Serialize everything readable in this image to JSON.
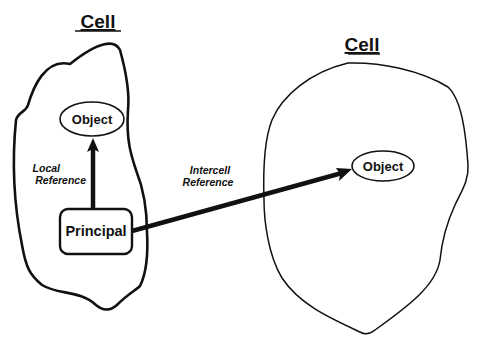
{
  "diagram": {
    "cells": [
      {
        "title": "Cell",
        "objects": [
          {
            "label": "Object"
          },
          {
            "label": "Principal"
          }
        ]
      },
      {
        "title": "Cell",
        "objects": [
          {
            "label": "Object"
          }
        ]
      }
    ],
    "edges": [
      {
        "from": "Principal",
        "to": "Object (left cell)",
        "label_line1": "Local",
        "label_line2": "Reference"
      },
      {
        "from": "Principal",
        "to": "Object (right cell)",
        "label_line1": "Intercell",
        "label_line2": "Reference"
      }
    ],
    "colors": {
      "stroke": "#111111",
      "background": "#ffffff"
    }
  }
}
